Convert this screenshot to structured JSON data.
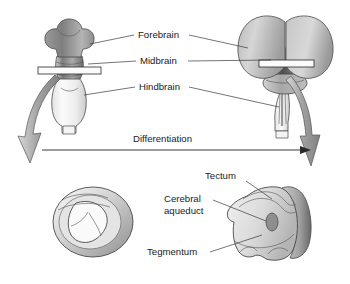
{
  "figure": {
    "background_color": "#ffffff"
  },
  "labels": {
    "forebrain": "Forebrain",
    "midbrain": "Midbrain",
    "hindbrain": "Hindbrain",
    "differentiation": "Differentiation",
    "tectum": "Tectum",
    "cerebral_aqueduct_line1": "Cerebral",
    "cerebral_aqueduct_line2": "aqueduct",
    "tegmentum": "Tegmentum"
  },
  "colors": {
    "label_text": "#1a1a1a",
    "leader_line": "#3a3a3a",
    "outline": "#4a4a4a",
    "arrow_fill": "#a8a8a8",
    "arrow_stroke": "#555555",
    "forebrain_dark": "#8a8a8a",
    "forebrain_light": "#cfcfcf",
    "midbrain_dark": "#6e6e6e",
    "hindbrain_light": "#f2f2f2",
    "section_plane": "#fbfbfb",
    "aqueduct": "#8e8e8e",
    "tectum_rim": "#6a6a6a"
  },
  "diagram": {
    "embryonic_brain": {
      "name": "embryonic brain",
      "parts": [
        "forebrain",
        "midbrain",
        "hindbrain"
      ],
      "section_plane": "midbrain cross-section plane"
    },
    "adult_brain": {
      "name": "adult brain",
      "parts": [
        "cerebral hemispheres",
        "midbrain",
        "pons",
        "medulla"
      ],
      "section_plane": "midbrain cross-section plane"
    },
    "embryonic_section": {
      "name": "embryonic midbrain cross-section",
      "features": [
        "neural canal lumen",
        "thick neuroepithelial wall"
      ]
    },
    "adult_section": {
      "name": "adult midbrain cross-section",
      "features": [
        "tectum",
        "cerebral aqueduct",
        "tegmentum"
      ]
    },
    "arrows": {
      "left_down": "embryonic brain to embryonic section",
      "right_down": "adult brain to adult section",
      "horizontal": "differentiation direction arrow"
    }
  }
}
